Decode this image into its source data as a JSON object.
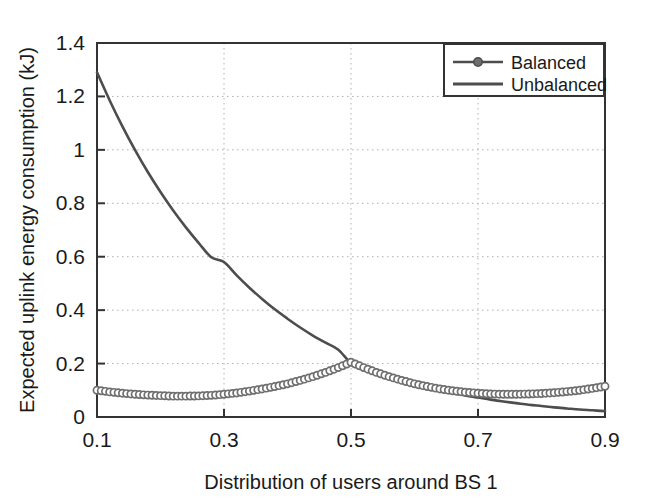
{
  "chart_data": {
    "type": "line",
    "title": "",
    "xlabel": "Distribution of users around BS 1",
    "ylabel": "Expected uplink energy consumption (kJ)",
    "xlim": [
      0.1,
      0.9
    ],
    "ylim": [
      0,
      1.4
    ],
    "xticks": [
      0.1,
      0.3,
      0.5,
      0.7,
      0.9
    ],
    "xtick_labels": [
      "0.1",
      "0.3",
      "0.5",
      "0.7",
      "0.9"
    ],
    "yticks": [
      0,
      0.2,
      0.4,
      0.6,
      0.8,
      1,
      1.2,
      1.4
    ],
    "ytick_labels": [
      "0",
      "0.2",
      "0.4",
      "0.6",
      "0.8",
      "1",
      "1.2",
      "1.4"
    ],
    "grid": true,
    "grid_style": "dotted",
    "legend_position": "top-right",
    "line_color": "#4d4d4d",
    "marker_color": "#6e6e6e",
    "axis_color": "#333333",
    "grid_color": "#b0b0b0",
    "x": [
      0.1,
      0.12,
      0.14,
      0.16,
      0.18,
      0.2,
      0.22,
      0.24,
      0.26,
      0.28,
      0.3,
      0.32,
      0.34,
      0.36,
      0.38,
      0.4,
      0.42,
      0.44,
      0.46,
      0.48,
      0.5,
      0.52,
      0.54,
      0.56,
      0.58,
      0.6,
      0.62,
      0.64,
      0.66,
      0.68,
      0.7,
      0.72,
      0.74,
      0.76,
      0.78,
      0.8,
      0.82,
      0.84,
      0.86,
      0.88,
      0.9
    ],
    "series": [
      {
        "name": "Balanced",
        "marker": "circle",
        "values": [
          0.1,
          0.094,
          0.089,
          0.085,
          0.082,
          0.08,
          0.078,
          0.078,
          0.079,
          0.081,
          0.085,
          0.09,
          0.097,
          0.105,
          0.114,
          0.124,
          0.137,
          0.151,
          0.167,
          0.185,
          0.205,
          0.185,
          0.167,
          0.151,
          0.137,
          0.124,
          0.114,
          0.105,
          0.098,
          0.093,
          0.089,
          0.086,
          0.085,
          0.085,
          0.086,
          0.088,
          0.091,
          0.095,
          0.1,
          0.107,
          0.115
        ]
      },
      {
        "name": "Unbalanced",
        "marker": "none",
        "values": [
          1.29,
          1.185,
          1.088,
          0.999,
          0.917,
          0.842,
          0.773,
          0.71,
          0.652,
          0.598,
          0.58,
          0.53,
          0.484,
          0.442,
          0.403,
          0.368,
          0.335,
          0.305,
          0.278,
          0.252,
          0.202,
          0.183,
          0.166,
          0.15,
          0.136,
          0.123,
          0.111,
          0.1,
          0.09,
          0.081,
          0.073,
          0.065,
          0.058,
          0.052,
          0.046,
          0.041,
          0.036,
          0.032,
          0.028,
          0.025,
          0.022
        ]
      }
    ]
  },
  "legend": {
    "items": [
      {
        "label": "Balanced"
      },
      {
        "label": "Unbalanced"
      }
    ]
  }
}
